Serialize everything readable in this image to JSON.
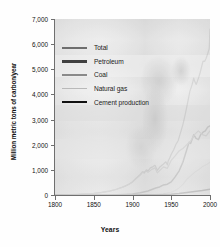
{
  "chart_data": {
    "type": "line",
    "title": "",
    "xlabel": "Years",
    "ylabel": "Million metric tons of carbon/year",
    "xlim": [
      1800,
      2000
    ],
    "ylim": [
      0,
      7000
    ],
    "xticks": [
      1800,
      1850,
      1900,
      1950,
      2000
    ],
    "xtick_labels": [
      "1800",
      "1850",
      "1900",
      "1950",
      "2000"
    ],
    "yticks": [
      0,
      1000,
      2000,
      3000,
      4000,
      5000,
      6000,
      7000
    ],
    "ytick_labels": [
      "0",
      "1,000",
      "2,000",
      "3,000",
      "4,000",
      "5,000",
      "6,000",
      "7,000"
    ],
    "grid": false,
    "legend_position": "upper-left",
    "series": [
      {
        "name": "Total",
        "color": "#6e6e6e",
        "x": [
          1800,
          1810,
          1820,
          1830,
          1840,
          1850,
          1860,
          1870,
          1875,
          1880,
          1885,
          1890,
          1895,
          1900,
          1905,
          1910,
          1913,
          1915,
          1918,
          1920,
          1923,
          1926,
          1929,
          1932,
          1935,
          1938,
          1940,
          1943,
          1945,
          1946,
          1948,
          1950,
          1953,
          1956,
          1959,
          1962,
          1965,
          1968,
          1971,
          1974,
          1977,
          1979,
          1980,
          1982,
          1983,
          1985,
          1987,
          1989,
          1991,
          1993,
          1995,
          1997,
          1999,
          2000
        ],
        "y": [
          8,
          12,
          18,
          28,
          45,
          60,
          100,
          150,
          190,
          240,
          290,
          350,
          420,
          530,
          680,
          820,
          930,
          870,
          1000,
          950,
          1080,
          1120,
          1180,
          980,
          1100,
          1180,
          1230,
          1320,
          1200,
          1350,
          1470,
          1620,
          1790,
          2010,
          2170,
          2480,
          2800,
          3200,
          3650,
          4120,
          4400,
          4650,
          4540,
          4400,
          4460,
          4640,
          4830,
          5080,
          5320,
          5310,
          5440,
          5620,
          5820,
          6600
        ]
      },
      {
        "name": "Petroleum",
        "color": "#404040",
        "x": [
          1800,
          1850,
          1870,
          1880,
          1890,
          1900,
          1910,
          1920,
          1930,
          1935,
          1940,
          1945,
          1950,
          1955,
          1960,
          1965,
          1970,
          1973,
          1975,
          1979,
          1982,
          1985,
          1988,
          1991,
          1994,
          1997,
          2000
        ],
        "y": [
          0,
          0,
          5,
          12,
          25,
          45,
          90,
          160,
          280,
          320,
          400,
          430,
          520,
          720,
          950,
          1300,
          1800,
          2100,
          2050,
          2400,
          2250,
          2200,
          2400,
          2500,
          2550,
          2700,
          2750
        ]
      },
      {
        "name": "Coal",
        "color": "#8a8a8a",
        "x": [
          1800,
          1820,
          1840,
          1850,
          1860,
          1870,
          1880,
          1890,
          1900,
          1905,
          1910,
          1913,
          1918,
          1920,
          1925,
          1929,
          1932,
          1937,
          1940,
          1945,
          1950,
          1955,
          1960,
          1965,
          1970,
          1975,
          1980,
          1985,
          1990,
          1995,
          2000
        ],
        "y": [
          8,
          18,
          45,
          58,
          98,
          148,
          230,
          340,
          510,
          650,
          790,
          900,
          950,
          900,
          1020,
          1080,
          880,
          1030,
          1120,
          1060,
          1380,
          1560,
          1750,
          1850,
          2000,
          2150,
          2400,
          2550,
          2400,
          2350,
          2550
        ]
      },
      {
        "name": "Natural gas",
        "color": "#b9b9b9",
        "x": [
          1800,
          1880,
          1900,
          1920,
          1930,
          1940,
          1950,
          1955,
          1960,
          1965,
          1970,
          1975,
          1980,
          1985,
          1990,
          1995,
          2000
        ],
        "y": [
          0,
          0,
          5,
          15,
          30,
          60,
          110,
          180,
          280,
          420,
          620,
          760,
          900,
          1000,
          1120,
          1200,
          1300
        ]
      },
      {
        "name": "Cement production",
        "color": "#111111",
        "x": [
          1800,
          1900,
          1920,
          1940,
          1950,
          1960,
          1970,
          1980,
          1990,
          2000
        ],
        "y": [
          0,
          3,
          8,
          18,
          30,
          60,
          100,
          140,
          180,
          230
        ]
      }
    ]
  },
  "legend": {
    "items": [
      {
        "label": "Total",
        "color": "#6e6e6e",
        "weight": 2.0
      },
      {
        "label": "Petroleum",
        "color": "#404040",
        "weight": 2.4
      },
      {
        "label": "Coal",
        "color": "#8a8a8a",
        "weight": 2.0
      },
      {
        "label": "Natural gas",
        "color": "#b9b9b9",
        "weight": 1.8
      },
      {
        "label": "Cement production",
        "color": "#111111",
        "weight": 2.4
      }
    ]
  }
}
